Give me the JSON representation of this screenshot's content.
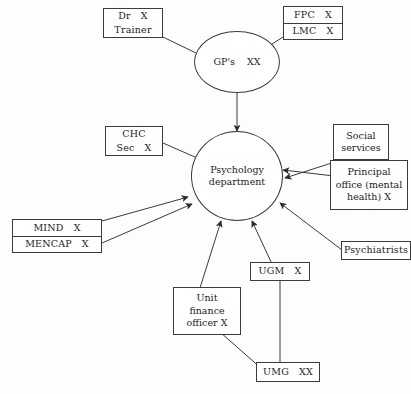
{
  "diagram": {
    "nodes": {
      "dr_trainer": {
        "line1": "Dr",
        "mark1": "X",
        "line2": "Trainer"
      },
      "fpc_lmc": {
        "line1": "FPC",
        "mark1": "X",
        "line2": "LMC",
        "mark2": "X"
      },
      "gps": {
        "label": "GP's",
        "mark": "XX"
      },
      "chc": {
        "line1": "CHC",
        "line2": "Sec",
        "mark2": "X"
      },
      "mind_mencap": {
        "line1": "MIND",
        "mark1": "X",
        "line2": "MENCAP",
        "mark2": "X"
      },
      "psychology": {
        "line1": "Psychology",
        "line2": "department"
      },
      "social_services": {
        "line1": "Social",
        "line2": "services"
      },
      "principal_office": {
        "line1": "Principal",
        "line2": "office (mental",
        "line3": "health)",
        "mark3": "X"
      },
      "psychiatrists": {
        "label": "Psychiatrists"
      },
      "unit_finance_officer": {
        "line1": "Unit",
        "line2": "finance",
        "line3": "officer",
        "mark3": "X"
      },
      "ugm": {
        "label": "UGM",
        "mark": "X"
      },
      "umg": {
        "label": "UMG",
        "mark": "XX"
      }
    },
    "colors": {
      "stroke": "#3b3b3b",
      "text": "#1c1c1c",
      "background": "#fdfdfc"
    }
  }
}
